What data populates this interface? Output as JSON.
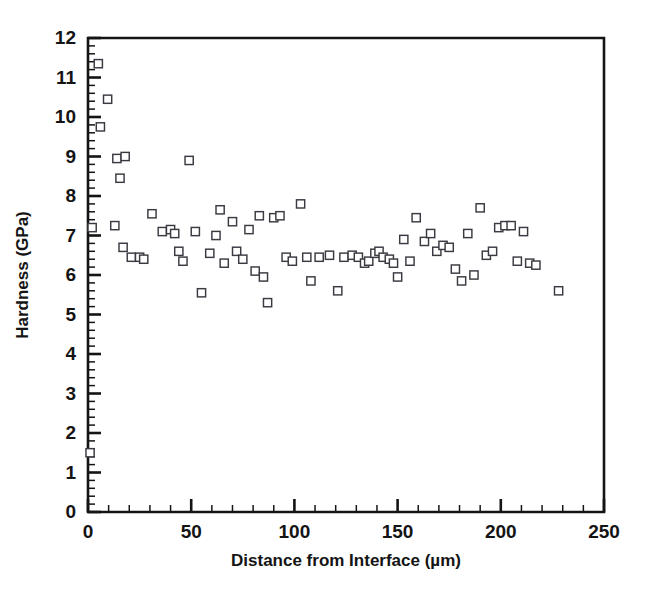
{
  "chart_data": {
    "type": "scatter",
    "title": "",
    "xlabel": "Distance from Interface (µm)",
    "ylabel": "Hardness (GPa)",
    "xlim": [
      0,
      250
    ],
    "ylim": [
      0,
      12
    ],
    "xticks": [
      0,
      50,
      100,
      150,
      200,
      250
    ],
    "yticks": [
      0,
      1,
      2,
      3,
      4,
      5,
      6,
      7,
      8,
      9,
      10,
      11,
      12
    ],
    "x_minor_tick_step": 10,
    "y_minor_tick_step": 0.2,
    "grid": false,
    "legend": null,
    "marker": "open-square",
    "marker_color": "#3a3a42",
    "frame_color": "#141414",
    "background": "#ffffff",
    "series": [
      {
        "name": "Hardness profile",
        "points": [
          [
            1.0,
            1.5
          ],
          [
            2.0,
            7.2
          ],
          [
            5.0,
            11.35
          ],
          [
            9.5,
            10.45
          ],
          [
            6.0,
            9.75
          ],
          [
            14.0,
            8.95
          ],
          [
            18.0,
            9.0
          ],
          [
            15.5,
            8.45
          ],
          [
            13.0,
            7.25
          ],
          [
            17.0,
            6.7
          ],
          [
            21.0,
            6.45
          ],
          [
            25.0,
            6.45
          ],
          [
            27.0,
            6.4
          ],
          [
            31.0,
            7.55
          ],
          [
            36.0,
            7.1
          ],
          [
            40.0,
            7.15
          ],
          [
            42.0,
            7.05
          ],
          [
            44.0,
            6.6
          ],
          [
            46.0,
            6.35
          ],
          [
            49.0,
            8.9
          ],
          [
            52.0,
            7.1
          ],
          [
            55.0,
            5.55
          ],
          [
            59.0,
            6.55
          ],
          [
            62.0,
            7.0
          ],
          [
            64.0,
            7.65
          ],
          [
            66.0,
            6.3
          ],
          [
            70.0,
            7.35
          ],
          [
            72.0,
            6.6
          ],
          [
            75.0,
            6.4
          ],
          [
            78.0,
            7.15
          ],
          [
            81.0,
            6.1
          ],
          [
            83.0,
            7.5
          ],
          [
            85.0,
            5.95
          ],
          [
            87.0,
            5.3
          ],
          [
            90.0,
            7.45
          ],
          [
            93.0,
            7.5
          ],
          [
            96.0,
            6.45
          ],
          [
            99.0,
            6.35
          ],
          [
            103.0,
            7.8
          ],
          [
            106.0,
            6.45
          ],
          [
            108.0,
            5.85
          ],
          [
            112.0,
            6.45
          ],
          [
            117.0,
            6.5
          ],
          [
            121.0,
            5.6
          ],
          [
            124.0,
            6.45
          ],
          [
            128.0,
            6.5
          ],
          [
            131.0,
            6.45
          ],
          [
            134.0,
            6.3
          ],
          [
            136.0,
            6.35
          ],
          [
            139.0,
            6.55
          ],
          [
            141.0,
            6.6
          ],
          [
            143.0,
            6.45
          ],
          [
            146.0,
            6.4
          ],
          [
            148.0,
            6.3
          ],
          [
            150.0,
            5.95
          ],
          [
            153.0,
            6.9
          ],
          [
            156.0,
            6.35
          ],
          [
            159.0,
            7.45
          ],
          [
            163.0,
            6.85
          ],
          [
            166.0,
            7.05
          ],
          [
            169.0,
            6.6
          ],
          [
            172.0,
            6.75
          ],
          [
            175.0,
            6.7
          ],
          [
            178.0,
            6.15
          ],
          [
            181.0,
            5.85
          ],
          [
            184.0,
            7.05
          ],
          [
            187.0,
            6.0
          ],
          [
            190.0,
            7.7
          ],
          [
            193.0,
            6.5
          ],
          [
            196.0,
            6.6
          ],
          [
            199.0,
            7.2
          ],
          [
            202.0,
            7.25
          ],
          [
            205.0,
            7.25
          ],
          [
            208.0,
            6.35
          ],
          [
            211.0,
            7.1
          ],
          [
            214.0,
            6.3
          ],
          [
            217.0,
            6.25
          ],
          [
            228.0,
            5.6
          ]
        ]
      }
    ]
  }
}
